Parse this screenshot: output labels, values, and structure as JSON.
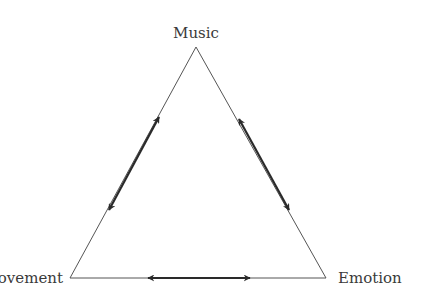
{
  "diagram": {
    "type": "triangle-relationship",
    "nodes": [
      {
        "id": "music",
        "label": "Music",
        "position": "top"
      },
      {
        "id": "movement",
        "label": "Movement",
        "position": "bottom-left",
        "visible_text": "vement"
      },
      {
        "id": "emotion",
        "label": "Emotion",
        "position": "bottom-right"
      }
    ],
    "edges": [
      {
        "from": "music",
        "to": "movement",
        "bidirectional": true
      },
      {
        "from": "music",
        "to": "emotion",
        "bidirectional": true
      },
      {
        "from": "movement",
        "to": "emotion",
        "bidirectional": true
      }
    ],
    "colors": {
      "line": "#444444",
      "arrow": "#2a2a2a",
      "text": "#3a3a3a"
    }
  }
}
